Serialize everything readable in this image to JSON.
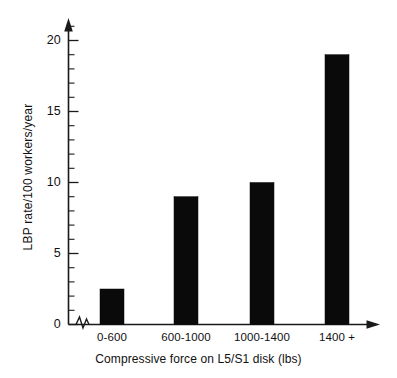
{
  "chart_data": {
    "type": "bar",
    "title": "",
    "subtitle": "",
    "xlabel": "Compressive force on L5/S1 disk (lbs)",
    "ylabel": "LBP rate/100 workers/year",
    "categories": [
      "0-600",
      "600-1000",
      "1000-1400",
      "1400 +"
    ],
    "values": [
      2.5,
      9,
      10,
      19
    ],
    "series": [
      {
        "name": "LBP rate",
        "values": [
          2.5,
          9,
          10,
          19
        ]
      }
    ],
    "ylim": [
      0,
      20.8
    ],
    "xlim": [
      0,
      4
    ],
    "y_ticks": [
      0,
      5,
      10,
      15,
      20
    ],
    "y_tick_labels": [
      "0",
      "5",
      "10",
      "15",
      "20"
    ],
    "y_minor_tick_step": 1,
    "grid": false,
    "legend": false,
    "legend_position": "none",
    "bar_color": "#0a0a0a",
    "axis_color": "#1a1a1a",
    "background_color": "#ffffff",
    "axis_arrows": true,
    "x_axis_break": true,
    "annotations": []
  },
  "axes": {
    "y_tick_labels": [
      "20",
      "15",
      "10",
      "5",
      "0"
    ],
    "x_tick_labels": [
      "0-600",
      "600-1000",
      "1000-1400",
      "1400 +"
    ],
    "y_title": "LBP rate/100 workers/year",
    "x_title": "Compressive force on L5/S1 disk (lbs)"
  },
  "icons": {
    "y_axis_arrow": "arrow-up-icon",
    "x_axis_arrow": "arrow-right-icon",
    "axis_break": "axis-break-zigzag-icon"
  }
}
